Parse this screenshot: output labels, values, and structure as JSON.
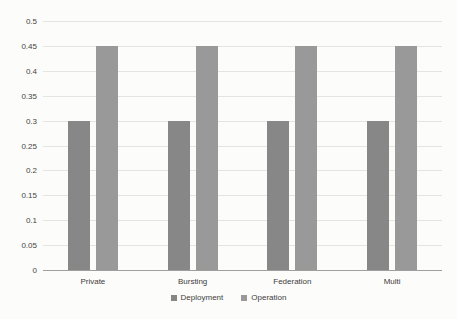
{
  "chart_data": {
    "type": "bar",
    "title": "",
    "xlabel": "",
    "ylabel": "",
    "categories": [
      "Private",
      "Bursting",
      "Federation",
      "Multi"
    ],
    "series": [
      {
        "name": "Deployment",
        "values": [
          0.3,
          0.3,
          0.3,
          0.3
        ],
        "color": "#878787"
      },
      {
        "name": "Operation",
        "values": [
          0.45,
          0.45,
          0.45,
          0.45
        ],
        "color": "#999999"
      }
    ],
    "ylim": [
      0,
      0.5
    ],
    "ytick_interval": 0.05,
    "ytick_labels": [
      "0",
      "0.05",
      "0.1",
      "0.15",
      "0.2",
      "0.25",
      "0.3",
      "0.35",
      "0.4",
      "0.45",
      "0.5"
    ],
    "grid": true,
    "legend_position": "bottom"
  },
  "colors": {
    "background": "#fcfcfa",
    "gridline": "#e4e4e0",
    "axis_line": "#9f9f9f",
    "tick_text": "#444444",
    "deployment_bar": "#878787",
    "operation_bar": "#999999"
  }
}
